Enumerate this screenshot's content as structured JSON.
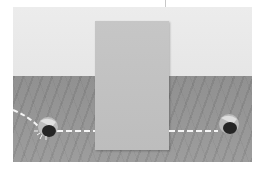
{
  "scene": {
    "description": "3D scene: ball rolls along dashed path, passes behind an occluding screen, reappears on the other side",
    "colors": {
      "background": "#ffffff",
      "wall": "#e8e8e8",
      "floor": "#929292",
      "screen": "#c2c2c2",
      "ball_dark": "#2a2a2a",
      "ball_light": "#cfcfcf",
      "dashed_path": "#f4f4f4"
    },
    "objects": [
      {
        "name": "occluder-screen",
        "x": 95,
        "y": 21,
        "width": 74,
        "height": 129
      },
      {
        "name": "ball-left",
        "cx": 47,
        "cy": 128,
        "r": 9
      },
      {
        "name": "ball-right",
        "cx": 229,
        "cy": 124,
        "r": 9
      }
    ],
    "trajectory": "dashed line entering from left edge, curving to left ball, then straight to occluder, continuing from occluder right edge to right ball"
  }
}
